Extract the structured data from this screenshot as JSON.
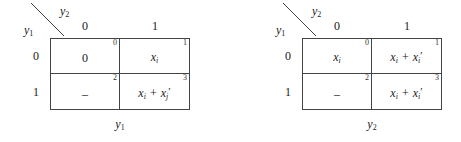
{
  "figure": {
    "maps": [
      {
        "id": "left-kmap",
        "corner": {
          "top_variable": "y",
          "top_variable_sub": "2",
          "side_variable": "y",
          "side_variable_sub": "1",
          "diagonal_icon": "diagonal-divider-icon"
        },
        "column_headers": [
          "0",
          "1"
        ],
        "row_headers": [
          "0",
          "1"
        ],
        "bottom_label": "y",
        "bottom_label_sub": "1",
        "cells": [
          {
            "index": "0",
            "row": "0",
            "col": "0",
            "value_plain": "0",
            "is_math": false,
            "terms": []
          },
          {
            "index": "1",
            "row": "0",
            "col": "1",
            "value_plain": "xi",
            "is_math": true,
            "terms": [
              {
                "base": "x",
                "sub": "i",
                "prime": false
              }
            ]
          },
          {
            "index": "2",
            "row": "1",
            "col": "0",
            "value_plain": "–",
            "is_math": false,
            "terms": []
          },
          {
            "index": "3",
            "row": "1",
            "col": "1",
            "value_plain": "xi + xj'",
            "is_math": true,
            "terms": [
              {
                "base": "x",
                "sub": "i",
                "prime": false
              },
              {
                "base": "x",
                "sub": "j",
                "prime": true
              }
            ]
          }
        ]
      },
      {
        "id": "right-kmap",
        "corner": {
          "top_variable": "y",
          "top_variable_sub": "2",
          "side_variable": "y",
          "side_variable_sub": "1",
          "diagonal_icon": "diagonal-divider-icon"
        },
        "column_headers": [
          "0",
          "1"
        ],
        "row_headers": [
          "0",
          "1"
        ],
        "bottom_label": "y",
        "bottom_label_sub": "2",
        "cells": [
          {
            "index": "0",
            "row": "0",
            "col": "0",
            "value_plain": "xi",
            "is_math": true,
            "terms": [
              {
                "base": "x",
                "sub": "i",
                "prime": false
              }
            ]
          },
          {
            "index": "1",
            "row": "0",
            "col": "1",
            "value_plain": "xi + xi'",
            "is_math": true,
            "terms": [
              {
                "base": "x",
                "sub": "i",
                "prime": false
              },
              {
                "base": "x",
                "sub": "i",
                "prime": true
              }
            ]
          },
          {
            "index": "2",
            "row": "1",
            "col": "0",
            "value_plain": "–",
            "is_math": false,
            "terms": []
          },
          {
            "index": "3",
            "row": "1",
            "col": "1",
            "value_plain": "xi + xi'",
            "is_math": true,
            "terms": [
              {
                "base": "x",
                "sub": "i",
                "prime": false
              },
              {
                "base": "x",
                "sub": "i",
                "prime": true
              }
            ]
          }
        ]
      }
    ],
    "colors": {
      "line": "#444444",
      "text": "#1a1a1a",
      "background": "#ffffff"
    }
  }
}
